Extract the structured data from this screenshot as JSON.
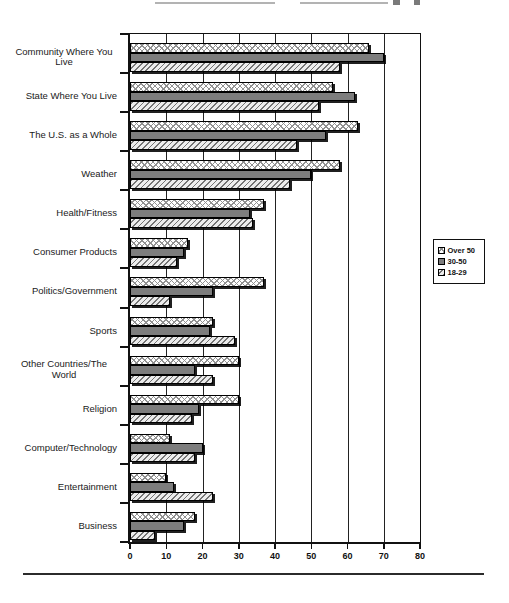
{
  "chart_data": {
    "type": "bar",
    "orientation": "horizontal",
    "title": "",
    "categories": [
      "Community Where You Live",
      "State Where You Live",
      "The U.S. as a Whole",
      "Weather",
      "Health/Fitness",
      "Consumer Products",
      "Politics/Government",
      "Sports",
      "Other Countries/The World",
      "Religion",
      "Computer/Technology",
      "Entertainment",
      "Business"
    ],
    "series": [
      {
        "name": "Over 50",
        "pattern": "crosshatch",
        "fill": "#ffffff",
        "hatch_color": "#8c8c8c",
        "values": [
          66,
          56,
          63,
          58,
          37,
          16,
          37,
          23,
          30,
          30,
          11,
          10,
          18
        ]
      },
      {
        "name": "30-50",
        "pattern": "solid",
        "fill": "#7d7d7d",
        "values": [
          70,
          62,
          54,
          50,
          33,
          15,
          23,
          22,
          18,
          19,
          20,
          12,
          15
        ]
      },
      {
        "name": "18-29",
        "pattern": "diagonal-hatch",
        "fill": "#ededed",
        "hatch_color": "#6e6e6e",
        "values": [
          58,
          52,
          46,
          44,
          34,
          13,
          11,
          29,
          23,
          17,
          18,
          23,
          7
        ]
      }
    ],
    "xlim": [
      0,
      80
    ],
    "xticks": [
      0,
      10,
      20,
      30,
      40,
      50,
      60,
      70,
      80
    ],
    "grid": true,
    "legend_position": "right",
    "bar_order": "Over 50 top, 30-50 middle, 18-29 bottom within each category group"
  },
  "legend": {
    "items": [
      "Over 50",
      "30-50",
      "18-29"
    ]
  },
  "colors": {
    "axis": "#111111",
    "solid_bar": "#7d7d7d",
    "background": "#ffffff"
  }
}
